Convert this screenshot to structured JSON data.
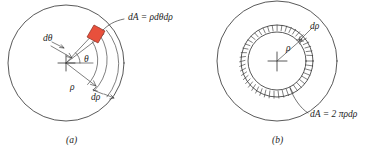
{
  "figure": {
    "type": "diagram",
    "background_color": "#ffffff",
    "line_color": "#2e2e2e",
    "accent_color": "#e8503c"
  },
  "panel_a": {
    "caption": "(a)",
    "labels": {
      "area_element": "dA = ρdθdρ",
      "d_theta": "dθ",
      "theta": "θ",
      "rho": "ρ",
      "d_rho": "dρ"
    },
    "geometry": {
      "center_x": 66,
      "center_y": 63,
      "outer_radius": 58,
      "inner_arc_radius": 34,
      "outer_arc_radius": 44,
      "patch_angle_deg": -52,
      "theta_arc_radius": 14
    }
  },
  "panel_b": {
    "caption": "(b)",
    "labels": {
      "area_element": "dA = 2 πρdρ",
      "rho": "ρ",
      "d_rho": "dρ"
    },
    "geometry": {
      "center_x": 277,
      "center_y": 61,
      "outer_radius": 60,
      "ring_inner_radius": 29,
      "ring_outer_radius": 36,
      "ring_tick_count": 46
    }
  }
}
